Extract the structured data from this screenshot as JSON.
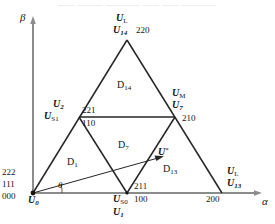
{
  "figure": {
    "axes": {
      "x_label": "α",
      "y_label": "β",
      "angle_label": "θ"
    },
    "bleed_text": "—— ——— ———— —— —— ————"
  },
  "vertices": {
    "origin": {
      "vec": "U",
      "sub": "0",
      "switching": [
        "222",
        "111",
        "000"
      ],
      "x": 33,
      "y": 193
    },
    "apex": {
      "vec1": "U",
      "sub1": "L",
      "vec2": "U",
      "sub2": "14",
      "switching": "220",
      "x": 127,
      "y": 40
    },
    "left_mid": {
      "vec1": "U",
      "sub1": "2",
      "vec2": "U",
      "sub2": "S1",
      "switching_top": "221",
      "switching_bot": "110",
      "x": 79,
      "y": 117
    },
    "right_mid": {
      "vec1": "U",
      "sub1": "M",
      "vec2": "U",
      "sub2": "7",
      "switching": "210",
      "x": 175,
      "y": 117
    },
    "bottom_mid": {
      "vec1": "U",
      "sub1": "S0",
      "vec2": "U",
      "sub2": "1",
      "switching_top": "211",
      "switching_bot": "100",
      "x": 127,
      "y": 193
    },
    "bottom_right": {
      "vec1": "U",
      "sub1": "L",
      "vec2": "U",
      "sub2": "13",
      "switching": "200",
      "x": 222,
      "y": 193
    }
  },
  "regions": [
    {
      "name": "D",
      "sub": "14"
    },
    {
      "name": "D",
      "sub": "7"
    },
    {
      "name": "D",
      "sub": "1"
    },
    {
      "name": "D",
      "sub": "13"
    }
  ],
  "reference_vector": {
    "vec": "U",
    "sup": "*",
    "tip_x": 163,
    "tip_y": 155
  },
  "colors": {
    "line": "#262626",
    "axis": "#8c8c8c",
    "text": "#141414",
    "background": "#ffffff"
  }
}
